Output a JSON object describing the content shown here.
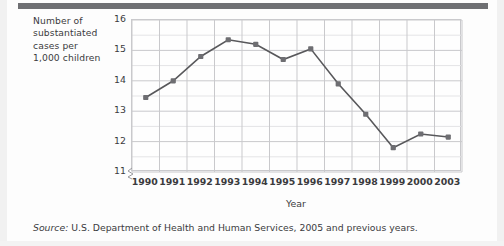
{
  "figure": {
    "y_axis_caption_lines": [
      "Number of",
      "substantiated",
      "cases per",
      "1,000 children"
    ],
    "x_axis_title": "Year",
    "source_prefix": "Source:",
    "source_text": "U.S. Department of Health and Human Services, 2005 and previous years.",
    "colors": {
      "line": "#58585b",
      "marker": "#6e6e72",
      "grid_major": "#c9c9cc",
      "grid_minor": "#e4e4e6",
      "frame": "#c9c9cc",
      "text": "#3b3b3d",
      "banner": "#6f7073"
    }
  },
  "chart_data": {
    "type": "line",
    "title": "",
    "subtitle": "",
    "xlabel": "Year",
    "ylabel": "Number of substantiated cases per 1,000 children",
    "categories": [
      "1990",
      "1991",
      "1992",
      "1993",
      "1994",
      "1995",
      "1996",
      "1997",
      "1998",
      "1999",
      "2000",
      "2003"
    ],
    "values": [
      13.45,
      14.0,
      14.8,
      15.35,
      15.2,
      14.7,
      15.05,
      13.9,
      12.9,
      11.8,
      12.25,
      12.15
    ],
    "series": [
      {
        "name": "Substantiated child maltreatment cases per 1,000 children",
        "values": [
          13.45,
          14.0,
          14.8,
          15.35,
          15.2,
          14.7,
          15.05,
          13.9,
          12.9,
          11.8,
          12.25,
          12.15
        ]
      }
    ],
    "ylim": [
      11,
      16
    ],
    "yticks": [
      11,
      12,
      13,
      14,
      15,
      16
    ],
    "ytick_labels": [
      "11",
      "12",
      "13",
      "14",
      "15",
      "16"
    ],
    "y_minor_step": 0.5,
    "xtick_labels": [
      "1990",
      "1991",
      "1992",
      "1993",
      "1994",
      "1995",
      "1996",
      "1997",
      "1998",
      "1999",
      "2000",
      "2003"
    ],
    "grid": true,
    "grid_axis": "both",
    "legend": false,
    "legend_position": "none",
    "marker": "square",
    "y_axis_break": true,
    "annotations": [],
    "source": "Source: U.S. Department of Health and Human Services, 2005 and previous years."
  }
}
